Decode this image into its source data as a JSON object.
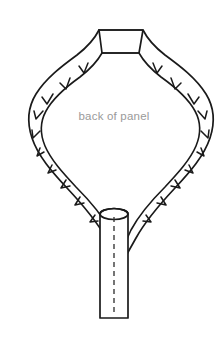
{
  "canvas": {
    "width": 224,
    "height": 346,
    "background_color": "#ffffff"
  },
  "diagram": {
    "type": "sewing-pattern",
    "title": "back of panel",
    "line_color": "#1a1a1a",
    "label_color": "#9a9a9a",
    "fill_color": "#ffffff"
  },
  "labels": {
    "panel_label": "back of panel"
  },
  "shapes": {
    "panel": {
      "name": "balloon-panel",
      "description": "teardrop balloon shaped fabric panel with seam allowance",
      "notch_count": 16
    },
    "neck": {
      "name": "trapezoid-neck",
      "description": "trapezoidal neck opening at top"
    },
    "tube": {
      "name": "cylinder-stick",
      "description": "cylindrical dowel with dashed center line",
      "has_dashed_centerline": true
    }
  }
}
